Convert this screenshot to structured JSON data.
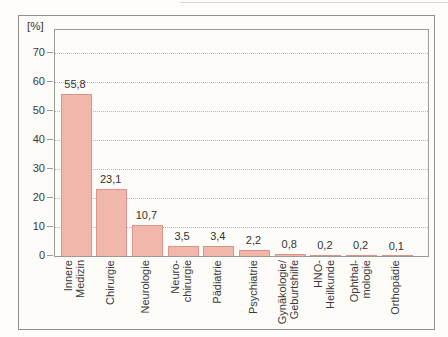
{
  "figure": {
    "background": "#fdfcf8",
    "frame_border_color": "#8e8e8c"
  },
  "chart_data": {
    "type": "bar",
    "title": "",
    "ylabel": "[%]",
    "xlabel": "",
    "categories": [
      "Innere\nMedizin",
      "Chirurgie",
      "Neurologie",
      "Neuro-\nchirurgie",
      "Pädiatrie",
      "Psychiatrie",
      "Gynäkologie/\nGeburtshilfe",
      "HNO-\nHeilkunde",
      "Ophthal-\nmologie",
      "Orthopädie"
    ],
    "values": [
      55.8,
      23.1,
      10.7,
      3.5,
      3.4,
      2.2,
      0.8,
      0.2,
      0.2,
      0.1
    ],
    "value_labels": [
      "55,8",
      "23,1",
      "10,7",
      "3,5",
      "3,4",
      "2,2",
      "0,8",
      "0,2",
      "0,2",
      "0,1"
    ],
    "yticks": [
      0,
      10,
      20,
      30,
      40,
      50,
      60,
      70
    ],
    "ylim": [
      0,
      77.9
    ],
    "grid": "horizontal-dotted",
    "legend": "none",
    "bar_color": "#f2b7ab",
    "bar_border_color": "#dd9488",
    "gridline_color": "#b9b6b0"
  }
}
